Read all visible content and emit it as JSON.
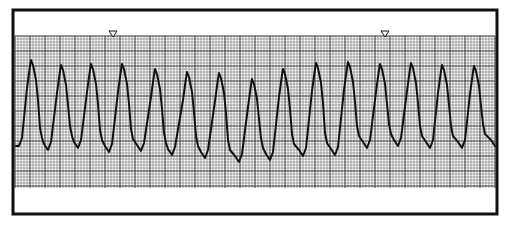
{
  "strip": {
    "description": "Rhythm strip on grid paper",
    "frame": {
      "x": 13,
      "y": 10,
      "width": 484,
      "height": 204,
      "stroke": "#111111"
    },
    "grid": {
      "x": 15,
      "y": 36,
      "width": 480,
      "height": 152,
      "minor": 3,
      "major": 15,
      "minor_color": "#8a8a8a",
      "major_color": "#333333"
    },
    "markers": [
      {
        "name": "marker-1",
        "x": 113,
        "y": 31
      },
      {
        "name": "marker-2",
        "x": 385,
        "y": 31
      }
    ],
    "trace_color": "#111111"
  },
  "chart_data": {
    "type": "line",
    "title": "",
    "xlabel": "",
    "ylabel": "",
    "grid": true,
    "beats": [
      {
        "peak_x": 31,
        "peak_y": 60,
        "trough_x": 19,
        "trough_y": 146
      },
      {
        "peak_x": 61,
        "peak_y": 65,
        "trough_x": 48,
        "trough_y": 150
      },
      {
        "peak_x": 91,
        "peak_y": 64,
        "trough_x": 78,
        "trough_y": 148
      },
      {
        "peak_x": 122,
        "peak_y": 64,
        "trough_x": 109,
        "trough_y": 152
      },
      {
        "peak_x": 155,
        "peak_y": 69,
        "trough_x": 141,
        "trough_y": 151
      },
      {
        "peak_x": 187,
        "peak_y": 72,
        "trough_x": 172,
        "trough_y": 155
      },
      {
        "peak_x": 219,
        "peak_y": 73,
        "trough_x": 205,
        "trough_y": 158
      },
      {
        "peak_x": 252,
        "peak_y": 79,
        "trough_x": 239,
        "trough_y": 162
      },
      {
        "peak_x": 283,
        "peak_y": 69,
        "trough_x": 270,
        "trough_y": 160
      },
      {
        "peak_x": 316,
        "peak_y": 63,
        "trough_x": 303,
        "trough_y": 156
      },
      {
        "peak_x": 348,
        "peak_y": 62,
        "trough_x": 335,
        "trough_y": 155
      },
      {
        "peak_x": 380,
        "peak_y": 64,
        "trough_x": 367,
        "trough_y": 148
      },
      {
        "peak_x": 411,
        "peak_y": 63,
        "trough_x": 398,
        "trough_y": 146
      },
      {
        "peak_x": 442,
        "peak_y": 65,
        "trough_x": 430,
        "trough_y": 148
      },
      {
        "peak_x": 474,
        "peak_y": 66,
        "trough_x": 462,
        "trough_y": 148
      }
    ],
    "end": {
      "x": 495,
      "y": 146
    }
  }
}
